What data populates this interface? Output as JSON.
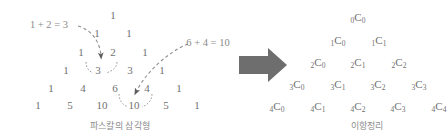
{
  "canvas": {
    "width": 448,
    "height": 139,
    "background": "#ffffff"
  },
  "colors": {
    "number_text": "#707070",
    "equation_text": "#8a8a8a",
    "caption_text": "#8d8d8d",
    "dashed_stroke": "#8f8f8f",
    "arrow_fill": "#6b6b6b",
    "big_arrow_fill": "#6e6e6e"
  },
  "left_panel": {
    "caption": "파스칼의 삼각형",
    "caption_pos": {
      "x": 120,
      "y": 126
    },
    "annotations": [
      {
        "id": "sum-left",
        "text": "1 + 2 = 3",
        "x": 49,
        "y": 25
      },
      {
        "id": "sum-right",
        "text": "6 + 4 = 10",
        "x": 208,
        "y": 43
      }
    ],
    "pascal_triangle": {
      "rows": [
        {
          "row_index": 0,
          "values": [
            "1"
          ]
        },
        {
          "row_index": 1,
          "values": [
            "1",
            "1"
          ]
        },
        {
          "row_index": 2,
          "values": [
            "1",
            "2",
            "1"
          ]
        },
        {
          "row_index": 3,
          "values": [
            "1",
            "3",
            "3",
            "1"
          ]
        },
        {
          "row_index": 4,
          "values": [
            "1",
            "4",
            "6",
            "4",
            "1"
          ]
        },
        {
          "row_index": 5,
          "values": [
            "1",
            "5",
            "10",
            "10",
            "5",
            "1"
          ]
        }
      ],
      "cells": [
        {
          "v": "1",
          "x": 113,
          "y": 15
        },
        {
          "v": "1",
          "x": 97,
          "y": 33
        },
        {
          "v": "1",
          "x": 129,
          "y": 33
        },
        {
          "v": "1",
          "x": 81,
          "y": 52
        },
        {
          "v": "2",
          "x": 113,
          "y": 52
        },
        {
          "v": "1",
          "x": 145,
          "y": 52
        },
        {
          "v": "1",
          "x": 66,
          "y": 70
        },
        {
          "v": "3",
          "x": 98,
          "y": 70
        },
        {
          "v": "3",
          "x": 130,
          "y": 70
        },
        {
          "v": "1",
          "x": 162,
          "y": 70
        },
        {
          "v": "1",
          "x": 51,
          "y": 88
        },
        {
          "v": "4",
          "x": 83,
          "y": 88
        },
        {
          "v": "6",
          "x": 115,
          "y": 88
        },
        {
          "v": "4",
          "x": 147,
          "y": 88
        },
        {
          "v": "1",
          "x": 179,
          "y": 88
        },
        {
          "v": "1",
          "x": 38,
          "y": 105
        },
        {
          "v": "5",
          "x": 70,
          "y": 105
        },
        {
          "v": "10",
          "x": 102,
          "y": 105
        },
        {
          "v": "10",
          "x": 134,
          "y": 105
        },
        {
          "v": "5",
          "x": 166,
          "y": 105
        },
        {
          "v": "1",
          "x": 197,
          "y": 105
        }
      ]
    }
  },
  "transform_arrow": {
    "name": "right-arrow",
    "x": 239,
    "y": 48,
    "width": 48,
    "height": 34
  },
  "right_panel": {
    "caption": "이항정리",
    "caption_pos": {
      "x": 367,
      "y": 126
    },
    "binomial_rows": [
      {
        "n": 0,
        "terms": [
          "0C0"
        ]
      },
      {
        "n": 1,
        "terms": [
          "1C0",
          "1C1"
        ]
      },
      {
        "n": 2,
        "terms": [
          "2C0",
          "2C1",
          "2C2"
        ]
      },
      {
        "n": 3,
        "terms": [
          "3C0",
          "3C1",
          "3C2",
          "3C3"
        ]
      },
      {
        "n": 4,
        "terms": [
          "4C0",
          "4C1",
          "4C2",
          "4C3",
          "4C4"
        ]
      }
    ],
    "cells": [
      {
        "n": "0",
        "r": "0",
        "x": 358,
        "y": 18
      },
      {
        "n": "1",
        "r": "0",
        "x": 338,
        "y": 41
      },
      {
        "n": "1",
        "r": "1",
        "x": 379,
        "y": 41
      },
      {
        "n": "2",
        "r": "0",
        "x": 318,
        "y": 63
      },
      {
        "n": "2",
        "r": "1",
        "x": 358,
        "y": 63
      },
      {
        "n": "2",
        "r": "2",
        "x": 399,
        "y": 63
      },
      {
        "n": "3",
        "r": "0",
        "x": 297,
        "y": 85
      },
      {
        "n": "3",
        "r": "1",
        "x": 338,
        "y": 85
      },
      {
        "n": "3",
        "r": "2",
        "x": 378,
        "y": 85
      },
      {
        "n": "3",
        "r": "3",
        "x": 419,
        "y": 85
      },
      {
        "n": "4",
        "r": "0",
        "x": 277,
        "y": 107
      },
      {
        "n": "4",
        "r": "1",
        "x": 318,
        "y": 107
      },
      {
        "n": "4",
        "r": "2",
        "x": 358,
        "y": 107
      },
      {
        "n": "4",
        "r": "3",
        "x": 398,
        "y": 107
      },
      {
        "n": "4",
        "r": "4",
        "x": 439,
        "y": 107
      }
    ]
  }
}
